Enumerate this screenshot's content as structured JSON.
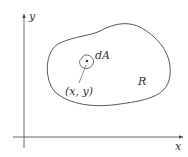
{
  "diagram": {
    "axes": {
      "x_label": "x",
      "y_label": "y"
    },
    "region_label": "R",
    "element_label": "dA",
    "point_label": "(x, y)",
    "colors": {
      "stroke": "#444444",
      "text": "#333333",
      "background": "#ffffff"
    }
  }
}
